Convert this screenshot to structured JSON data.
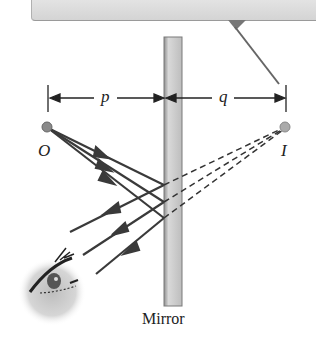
{
  "diagram": {
    "labels": {
      "object": "O",
      "image": "I",
      "object_distance": "p",
      "image_distance": "q",
      "mirror": "Mirror"
    },
    "colors": {
      "ray": "#3a3a3a",
      "mirror_fill": "#c8c8c8",
      "point": "#8a8a8a",
      "panel": "#dcdcdc"
    },
    "rays": {
      "incident_count": 3,
      "reflected_count": 3,
      "virtual_dashed_count": 3
    }
  }
}
